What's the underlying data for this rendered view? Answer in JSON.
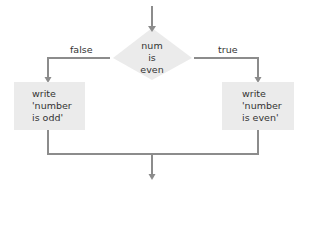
{
  "diagram": {
    "type": "flowchart",
    "decision": {
      "lines": [
        "num",
        "is",
        "even"
      ]
    },
    "branches": {
      "false_label": "false",
      "true_label": "true"
    },
    "left_box": {
      "lines": [
        "write",
        "'number",
        "is odd'"
      ]
    },
    "right_box": {
      "lines": [
        "write",
        "'number",
        "is even'"
      ]
    },
    "colors": {
      "line": "#8c8c8c",
      "shape_fill": "#ebebeb",
      "text": "#333333"
    }
  }
}
